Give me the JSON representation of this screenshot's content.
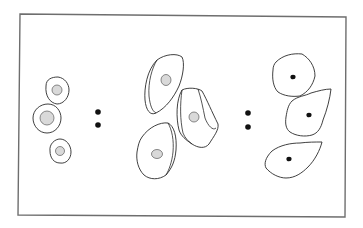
{
  "figure": {
    "frame": {
      "stroke": "#6e6e6e"
    },
    "groups": [
      {
        "name": "left-group",
        "description": "Small round cells with large stippled nuclei",
        "cell_count": 3
      },
      {
        "name": "middle-group",
        "description": "Larger irregular cells with folded double outlines and small stippled nuclei",
        "cell_count": 3
      },
      {
        "name": "right-group",
        "description": "Large flat polygonal cells with small dark pyknotic nuclei",
        "cell_count": 3
      }
    ],
    "separators": [
      {
        "name": "separator-1",
        "dots": 2
      },
      {
        "name": "separator-2",
        "dots": 2
      }
    ],
    "colors": {
      "outline": "#2a2a2a",
      "nucleus_fill": "#d9d9d9",
      "pyknotic_nucleus": "#111111"
    }
  }
}
